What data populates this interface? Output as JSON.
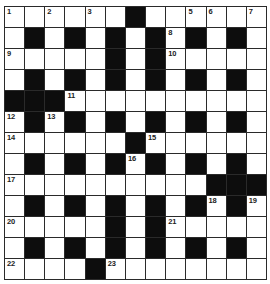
{
  "puzzle": {
    "rows": 13,
    "cols": 13,
    "colors": {
      "block": "#0d0d0d",
      "open": "#ffffff",
      "gridline": "#2a2a2a"
    },
    "grid": [
      "......#......",
      ".#.#.#.#.#.#.",
      ".....#.#.....",
      ".#.#.#.#.#.#.",
      "###..........",
      ".#.#.#.#.#.#.",
      "......#......",
      ".#.#.#.#.#.#.",
      "..........###",
      ".#.#.#.#.#.#.",
      ".....#.#.....",
      ".#.#.#.#.#.#.",
      "....#........"
    ],
    "numbers": [
      {
        "row": 0,
        "col": 0,
        "n": "1"
      },
      {
        "row": 0,
        "col": 2,
        "n": "2"
      },
      {
        "row": 0,
        "col": 4,
        "n": "3"
      },
      {
        "row": 0,
        "col": 6,
        "n": "4"
      },
      {
        "row": 0,
        "col": 9,
        "n": "5"
      },
      {
        "row": 0,
        "col": 10,
        "n": "6"
      },
      {
        "row": 0,
        "col": 12,
        "n": "7"
      },
      {
        "row": 1,
        "col": 8,
        "n": "8"
      },
      {
        "row": 2,
        "col": 0,
        "n": "9"
      },
      {
        "row": 2,
        "col": 8,
        "n": "10"
      },
      {
        "row": 4,
        "col": 3,
        "n": "11"
      },
      {
        "row": 5,
        "col": 0,
        "n": "12"
      },
      {
        "row": 5,
        "col": 2,
        "n": "13"
      },
      {
        "row": 6,
        "col": 0,
        "n": "14"
      },
      {
        "row": 6,
        "col": 7,
        "n": "15"
      },
      {
        "row": 7,
        "col": 6,
        "n": "16"
      },
      {
        "row": 8,
        "col": 0,
        "n": "17"
      },
      {
        "row": 9,
        "col": 10,
        "n": "18"
      },
      {
        "row": 9,
        "col": 12,
        "n": "19"
      },
      {
        "row": 10,
        "col": 0,
        "n": "20"
      },
      {
        "row": 10,
        "col": 8,
        "n": "21"
      },
      {
        "row": 12,
        "col": 0,
        "n": "22"
      },
      {
        "row": 12,
        "col": 5,
        "n": "23"
      }
    ]
  }
}
